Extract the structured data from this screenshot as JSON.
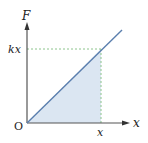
{
  "diagram": {
    "y_axis_label": "F",
    "x_axis_label": "x",
    "origin_label": "O",
    "y_marker_label": "kx",
    "x_marker_label": "x",
    "colors": {
      "axis": "#555555",
      "line": "#5b7fae",
      "fill": "#d6e2f0",
      "guide": "#7fbf7f"
    }
  }
}
